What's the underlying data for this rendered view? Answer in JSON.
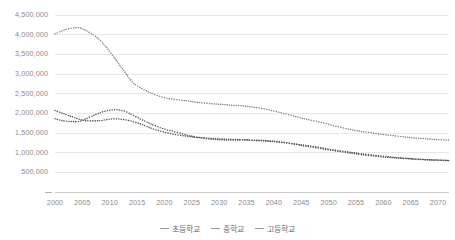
{
  "chart_data": {
    "type": "line",
    "title": "",
    "subtitle": "",
    "xlabel": "",
    "ylabel": "",
    "grid": true,
    "legend_position": "bottom-center",
    "line_style": "dotted",
    "xlim": [
      2000,
      2072
    ],
    "ylim": [
      0,
      4500000
    ],
    "y_ticks": [
      500000,
      1000000,
      1500000,
      2000000,
      2500000,
      3000000,
      3500000,
      4000000,
      4500000
    ],
    "y_tick_labels": [
      "500,000",
      "1,000,000",
      "1,500,000",
      "2,000,000",
      "2,500,000",
      "3,000,000",
      "3,500,000",
      "4,000,000",
      "4,500,000"
    ],
    "x_ticks": [
      2000,
      2005,
      2010,
      2015,
      2020,
      2025,
      2030,
      2035,
      2040,
      2045,
      2050,
      2055,
      2060,
      2065,
      2070
    ],
    "x_tick_labels": [
      "2000",
      "2005",
      "2010",
      "2015",
      "2020",
      "2025",
      "2030",
      "2035",
      "2040",
      "2045",
      "2050",
      "2055",
      "2060",
      "2065",
      "2070"
    ],
    "series": [
      {
        "name": "초등학교",
        "color": "#808080",
        "x": [
          2000,
          2002,
          2004,
          2005,
          2006,
          2008,
          2010,
          2012,
          2014,
          2015,
          2016,
          2018,
          2020,
          2022,
          2024,
          2025,
          2026,
          2028,
          2030,
          2032,
          2034,
          2035,
          2036,
          2038,
          2040,
          2042,
          2044,
          2045,
          2046,
          2048,
          2050,
          2052,
          2054,
          2055,
          2056,
          2058,
          2060,
          2062,
          2064,
          2065,
          2066,
          2068,
          2070,
          2072
        ],
        "values": [
          4020000,
          4130000,
          4180000,
          4150000,
          4080000,
          3890000,
          3570000,
          3190000,
          2820000,
          2700000,
          2620000,
          2490000,
          2400000,
          2350000,
          2320000,
          2300000,
          2280000,
          2250000,
          2230000,
          2210000,
          2190000,
          2180000,
          2160000,
          2120000,
          2060000,
          1990000,
          1920000,
          1880000,
          1850000,
          1790000,
          1720000,
          1650000,
          1590000,
          1560000,
          1540000,
          1500000,
          1460000,
          1430000,
          1400000,
          1380000,
          1370000,
          1350000,
          1330000,
          1320000
        ]
      },
      {
        "name": "중학교",
        "color": "#555555",
        "x": [
          2000,
          2002,
          2004,
          2005,
          2006,
          2008,
          2009,
          2010,
          2011,
          2012,
          2013,
          2014,
          2015,
          2016,
          2018,
          2020,
          2022,
          2024,
          2025,
          2026,
          2028,
          2030,
          2032,
          2034,
          2035,
          2036,
          2038,
          2040,
          2042,
          2044,
          2045,
          2046,
          2048,
          2050,
          2052,
          2054,
          2055,
          2056,
          2058,
          2060,
          2062,
          2064,
          2065,
          2066,
          2068,
          2070,
          2072
        ],
        "values": [
          1860000,
          1800000,
          1790000,
          1820000,
          1880000,
          2000000,
          2050000,
          2080000,
          2090000,
          2080000,
          2040000,
          1970000,
          1900000,
          1830000,
          1700000,
          1600000,
          1530000,
          1450000,
          1420000,
          1390000,
          1350000,
          1330000,
          1320000,
          1320000,
          1320000,
          1310000,
          1300000,
          1280000,
          1250000,
          1210000,
          1180000,
          1160000,
          1120000,
          1070000,
          1030000,
          990000,
          970000,
          950000,
          920000,
          890000,
          870000,
          850000,
          840000,
          830000,
          820000,
          810000,
          800000
        ]
      },
      {
        "name": "고등학교",
        "color": "#555555",
        "x": [
          2000,
          2002,
          2004,
          2005,
          2006,
          2008,
          2009,
          2010,
          2011,
          2012,
          2013,
          2014,
          2015,
          2016,
          2018,
          2020,
          2022,
          2024,
          2025,
          2026,
          2028,
          2030,
          2032,
          2034,
          2035,
          2036,
          2038,
          2040,
          2042,
          2044,
          2045,
          2046,
          2048,
          2050,
          2052,
          2054,
          2055,
          2056,
          2058,
          2060,
          2062,
          2064,
          2065,
          2066,
          2068,
          2070,
          2072
        ],
        "values": [
          2070000,
          1970000,
          1870000,
          1830000,
          1810000,
          1810000,
          1830000,
          1850000,
          1860000,
          1850000,
          1830000,
          1800000,
          1760000,
          1710000,
          1600000,
          1520000,
          1460000,
          1420000,
          1400000,
          1390000,
          1370000,
          1350000,
          1340000,
          1330000,
          1330000,
          1320000,
          1310000,
          1290000,
          1260000,
          1220000,
          1200000,
          1180000,
          1140000,
          1090000,
          1050000,
          1010000,
          990000,
          970000,
          940000,
          910000,
          880000,
          860000,
          850000,
          840000,
          820000,
          810000,
          800000
        ]
      }
    ]
  },
  "legend": {
    "items": [
      {
        "label": "초등학교"
      },
      {
        "label": "중학교"
      },
      {
        "label": "고등학교"
      }
    ]
  },
  "colors": {
    "grid": "#e8e8e8",
    "axis": "#cccccc",
    "tick_text": "#8a8a8a",
    "legend_text": "#6f6f6f"
  }
}
